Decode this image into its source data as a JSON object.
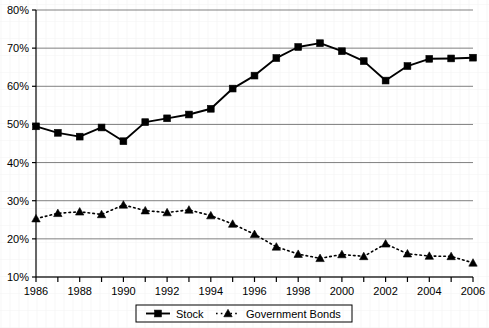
{
  "chart_data": {
    "type": "line",
    "title": "",
    "subtitle": "",
    "xlabel": "",
    "ylabel": "",
    "grid": true,
    "legend_position": "bottom",
    "xlim": [
      1986,
      2006
    ],
    "ylim": [
      10,
      80
    ],
    "ytick_labels": [
      "80%",
      "70%",
      "60%",
      "50%",
      "40%",
      "30%",
      "20%",
      "10%"
    ],
    "ytick_values": [
      80,
      70,
      60,
      50,
      40,
      30,
      20,
      10
    ],
    "x": [
      1986,
      1987,
      1988,
      1989,
      1990,
      1991,
      1992,
      1993,
      1994,
      1995,
      1996,
      1997,
      1998,
      1999,
      2000,
      2001,
      2002,
      2003,
      2004,
      2005,
      2006
    ],
    "xtick_labels": [
      "1986",
      "",
      "1988",
      "",
      "1990",
      "",
      "1992",
      "",
      "1994",
      "",
      "1996",
      "",
      "1998",
      "",
      "2000",
      "",
      "2002",
      "",
      "2004",
      "",
      "2006"
    ],
    "xtick_labels_shown": [
      "1986",
      "1988",
      "1990",
      "1992",
      "1994",
      "1996",
      "1998",
      "2000",
      "2002",
      "2004",
      "2006"
    ],
    "series": [
      {
        "name": "Stock",
        "marker": "square",
        "line_style": "solid",
        "color": "#000000",
        "values": [
          49.5,
          47.8,
          46.8,
          49.2,
          45.6,
          50.6,
          51.6,
          52.6,
          54.1,
          59.4,
          62.8,
          67.4,
          70.3,
          71.3,
          69.2,
          66.6,
          61.5,
          65.3,
          67.2,
          67.3,
          67.5
        ]
      },
      {
        "name": "Government Bonds",
        "marker": "triangle",
        "line_style": "dotted",
        "color": "#000000",
        "values": [
          25.3,
          26.7,
          27.1,
          26.4,
          28.9,
          27.4,
          26.9,
          27.6,
          26.1,
          23.9,
          21.2,
          17.9,
          16.0,
          14.9,
          15.9,
          15.4,
          18.7,
          16.1,
          15.5,
          15.4,
          13.7
        ]
      }
    ]
  },
  "legend": {
    "items": [
      {
        "label": "Stock",
        "marker": "square",
        "line_style": "solid"
      },
      {
        "label": "Government Bonds",
        "marker": "triangle",
        "line_style": "dotted"
      }
    ]
  },
  "colors": {
    "axis": "#000000",
    "grid": "#808080",
    "series": "#000000",
    "background": "#ffffff"
  }
}
